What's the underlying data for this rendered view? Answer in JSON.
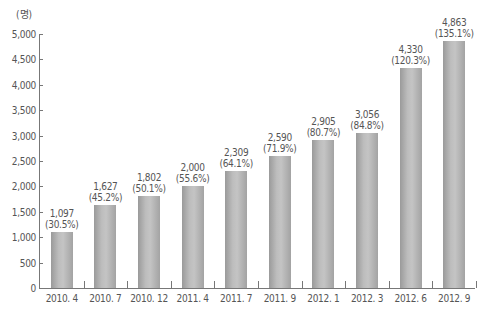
{
  "chart_data": {
    "type": "bar",
    "title": "",
    "xlabel": "",
    "ylabel": "(명)",
    "ylim": [
      0,
      5000
    ],
    "yticks": [
      "0",
      "500",
      "1,000",
      "1,500",
      "2,000",
      "2,500",
      "3,000",
      "3,500",
      "4,000",
      "4,500",
      "5,000"
    ],
    "grid": false,
    "legend": null,
    "categories": [
      "2010. 4",
      "2010. 7",
      "2010. 12",
      "2011. 4",
      "2011. 7",
      "2011. 9",
      "2012. 1",
      "2012. 3",
      "2012. 6",
      "2012. 9"
    ],
    "values": [
      1097,
      1627,
      1802,
      2000,
      2309,
      2590,
      2905,
      3056,
      4330,
      4863
    ],
    "value_labels": [
      "1,097",
      "1,627",
      "1,802",
      "2,000",
      "2,309",
      "2,590",
      "2,905",
      "3,056",
      "4,330",
      "4,863"
    ],
    "percent_labels": [
      "(30.5%)",
      "(45.2%)",
      "(50.1%)",
      "(55.6%)",
      "(64.1%)",
      "(71.9%)",
      "(80.7%)",
      "(84.8%)",
      "(120.3%)",
      "(135.1%)"
    ],
    "bar_color": "#b3b3b3"
  }
}
